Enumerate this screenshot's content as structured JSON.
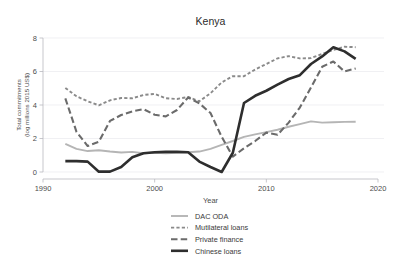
{
  "chart_data": {
    "type": "line",
    "title": "Kenya",
    "xlabel": "Year",
    "ylabel": "Total commitments\n(log millions 2015 US$)",
    "ylabel_line1": "Total commitments",
    "ylabel_line2": "(log millions 2015 US$)",
    "xlim": [
      1990,
      2020
    ],
    "ylim": [
      0,
      8
    ],
    "xticks": [
      1990,
      2000,
      2010,
      2020
    ],
    "yticks": [
      0,
      2,
      4,
      6,
      8
    ],
    "xtick_labels": [
      "1990",
      "2000",
      "2010",
      "2020"
    ],
    "ytick_labels": [
      "0",
      "2",
      "4",
      "6",
      "8"
    ],
    "grid": true,
    "grid_axis": "y",
    "legend_position": "bottom-center",
    "series": [
      {
        "name": "DAC ODA",
        "color": "#b5b5b5",
        "style": "solid",
        "width": 1.9,
        "x": [
          1992,
          1993,
          1994,
          1995,
          1996,
          1997,
          1998,
          1999,
          2000,
          2001,
          2002,
          2003,
          2004,
          2005,
          2006,
          2007,
          2008,
          2009,
          2010,
          2011,
          2012,
          2013,
          2014,
          2015,
          2016,
          2017,
          2018
        ],
        "values": [
          1.68,
          1.38,
          1.25,
          1.3,
          1.22,
          1.16,
          1.2,
          1.12,
          1.15,
          1.12,
          1.15,
          1.18,
          1.22,
          1.38,
          1.62,
          1.85,
          2.1,
          2.25,
          2.38,
          2.52,
          2.7,
          2.86,
          3.02,
          2.95,
          2.97,
          2.99,
          3.0
        ]
      },
      {
        "name": "Mutilateral loans",
        "color": "#8a8a8a",
        "style": "dashed-short",
        "width": 1.9,
        "x": [
          1992,
          1993,
          1994,
          1995,
          1996,
          1997,
          1998,
          1999,
          2000,
          2001,
          2002,
          2003,
          2004,
          2005,
          2006,
          2007,
          2008,
          2009,
          2010,
          2011,
          2012,
          2013,
          2014,
          2015,
          2016,
          2017,
          2018
        ],
        "values": [
          5.02,
          4.52,
          4.22,
          3.98,
          4.28,
          4.42,
          4.4,
          4.6,
          4.66,
          4.4,
          4.36,
          4.48,
          4.22,
          4.7,
          5.35,
          5.72,
          5.72,
          6.12,
          6.45,
          6.78,
          6.92,
          6.78,
          6.8,
          7.05,
          7.28,
          7.48,
          7.45
        ]
      },
      {
        "name": "Private finance",
        "color": "#6b6b6b",
        "style": "dashed-long",
        "width": 2.1,
        "x": [
          1992,
          1993,
          1994,
          1995,
          1996,
          1997,
          1998,
          1999,
          2000,
          2001,
          2002,
          2003,
          2004,
          2005,
          2006,
          2007,
          2008,
          2009,
          2010,
          2011,
          2012,
          2013,
          2014,
          2015,
          2016,
          2017,
          2018
        ],
        "values": [
          4.4,
          2.4,
          1.55,
          1.8,
          3.05,
          3.4,
          3.62,
          3.75,
          3.42,
          3.32,
          3.7,
          4.45,
          4.1,
          3.52,
          2.1,
          0.92,
          1.42,
          1.85,
          2.35,
          2.22,
          2.95,
          3.85,
          5.05,
          6.28,
          6.6,
          6.0,
          6.18
        ]
      },
      {
        "name": "Chinese loans",
        "color": "#2e2e2e",
        "style": "solid",
        "width": 2.6,
        "x": [
          1992,
          1993,
          1994,
          1995,
          1996,
          1997,
          1998,
          1999,
          2000,
          2001,
          2002,
          2003,
          2004,
          2005,
          2006,
          2007,
          2008,
          2009,
          2010,
          2011,
          2012,
          2013,
          2014,
          2015,
          2016,
          2017,
          2018
        ],
        "values": [
          0.65,
          0.65,
          0.62,
          0.02,
          0.02,
          0.3,
          0.88,
          1.12,
          1.18,
          1.2,
          1.2,
          1.18,
          0.62,
          0.3,
          0.0,
          1.15,
          4.12,
          4.55,
          4.85,
          5.22,
          5.55,
          5.78,
          6.45,
          6.9,
          7.45,
          7.2,
          6.75
        ]
      }
    ]
  },
  "legend": {
    "entries": [
      {
        "label": "DAC ODA"
      },
      {
        "label": "Mutilateral loans"
      },
      {
        "label": "Private finance"
      },
      {
        "label": "Chinese loans"
      }
    ]
  }
}
